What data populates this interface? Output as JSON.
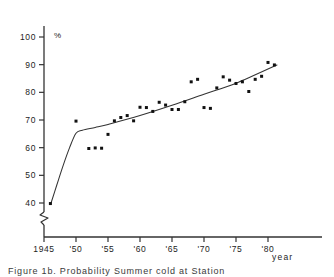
{
  "chart_data": {
    "type": "scatter",
    "title": "",
    "xlabel": "year",
    "ylabel": "%",
    "xlim": [
      1945,
      1983
    ],
    "ylim": [
      36,
      104
    ],
    "grid": false,
    "legend": null,
    "axis_break": {
      "axis": "y",
      "below": 40,
      "symbol": "zigzag"
    },
    "y_ticks": [
      40,
      50,
      60,
      70,
      80,
      90,
      100
    ],
    "y_tick_labels": [
      "40",
      "50",
      "60",
      "70",
      "80",
      "90",
      "100"
    ],
    "x_ticks": [
      1945,
      1950,
      1955,
      1960,
      1965,
      1970,
      1975,
      1980
    ],
    "x_tick_labels": [
      "1945",
      "'50",
      "'55",
      "'60",
      "'65",
      "'70",
      "'75",
      "'80"
    ],
    "points": [
      {
        "x": 1946,
        "y": 39.8
      },
      {
        "x": 1950,
        "y": 69.6
      },
      {
        "x": 1952,
        "y": 59.7
      },
      {
        "x": 1953,
        "y": 59.9
      },
      {
        "x": 1954,
        "y": 59.8
      },
      {
        "x": 1955,
        "y": 64.8
      },
      {
        "x": 1956,
        "y": 69.7
      },
      {
        "x": 1957,
        "y": 70.9
      },
      {
        "x": 1958,
        "y": 71.6
      },
      {
        "x": 1959,
        "y": 69.7
      },
      {
        "x": 1960,
        "y": 74.6
      },
      {
        "x": 1961,
        "y": 74.5
      },
      {
        "x": 1962,
        "y": 73.1
      },
      {
        "x": 1963,
        "y": 76.4
      },
      {
        "x": 1964,
        "y": 75.4
      },
      {
        "x": 1965,
        "y": 73.8
      },
      {
        "x": 1966,
        "y": 73.8
      },
      {
        "x": 1967,
        "y": 76.6
      },
      {
        "x": 1968,
        "y": 83.8
      },
      {
        "x": 1969,
        "y": 84.7
      },
      {
        "x": 1970,
        "y": 74.5
      },
      {
        "x": 1971,
        "y": 74.2
      },
      {
        "x": 1972,
        "y": 81.6
      },
      {
        "x": 1973,
        "y": 85.6
      },
      {
        "x": 1974,
        "y": 84.4
      },
      {
        "x": 1975,
        "y": 83.2
      },
      {
        "x": 1976,
        "y": 83.8
      },
      {
        "x": 1977,
        "y": 80.3
      },
      {
        "x": 1978,
        "y": 84.7
      },
      {
        "x": 1979,
        "y": 85.8
      },
      {
        "x": 1980,
        "y": 90.8
      },
      {
        "x": 1981,
        "y": 89.9
      }
    ],
    "fit_curve": [
      {
        "x": 1946.1,
        "y": 40.0
      },
      {
        "x": 1947.0,
        "y": 46.5
      },
      {
        "x": 1948.0,
        "y": 53.6
      },
      {
        "x": 1949.0,
        "y": 60.0
      },
      {
        "x": 1950.0,
        "y": 65.2
      },
      {
        "x": 1951.0,
        "y": 66.3
      },
      {
        "x": 1953.0,
        "y": 67.3
      },
      {
        "x": 1955.0,
        "y": 68.4
      },
      {
        "x": 1960.0,
        "y": 71.6
      },
      {
        "x": 1965.0,
        "y": 75.3
      },
      {
        "x": 1970.0,
        "y": 79.3
      },
      {
        "x": 1975.0,
        "y": 83.3
      },
      {
        "x": 1981.4,
        "y": 89.9
      }
    ],
    "series_note": "single series of annual observations with fitted trend curve"
  },
  "caption": "Figure 1b. Probability Summer cold at Station"
}
